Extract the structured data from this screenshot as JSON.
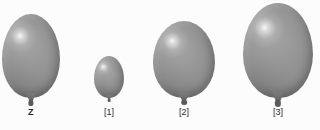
{
  "scene": {
    "title": "Four gray balloons of increasing size",
    "background_color": "#fcfcfc",
    "width": 320,
    "height": 130
  },
  "balloon_color": {
    "base": "#8d8d8d",
    "highlight": "#ffffff",
    "shadow": "#5f5f5f",
    "knot": "#5a5a5a"
  },
  "balloons": [
    {
      "id": "balloon-z",
      "label": "Z",
      "bold": true,
      "left": 2,
      "top": 14,
      "width": 58,
      "height": 84,
      "label_x": 31,
      "label_y": 107
    },
    {
      "id": "balloon-1",
      "label": "[1]",
      "bold": false,
      "left": 94,
      "top": 56,
      "width": 30,
      "height": 42,
      "label_x": 109,
      "label_y": 107
    },
    {
      "id": "balloon-2",
      "label": "[2]",
      "bold": false,
      "left": 153,
      "top": 21,
      "width": 62,
      "height": 77,
      "label_x": 184,
      "label_y": 107
    },
    {
      "id": "balloon-3",
      "label": "[3]",
      "bold": false,
      "left": 243,
      "top": 3,
      "width": 70,
      "height": 95,
      "label_x": 278,
      "label_y": 107
    }
  ]
}
